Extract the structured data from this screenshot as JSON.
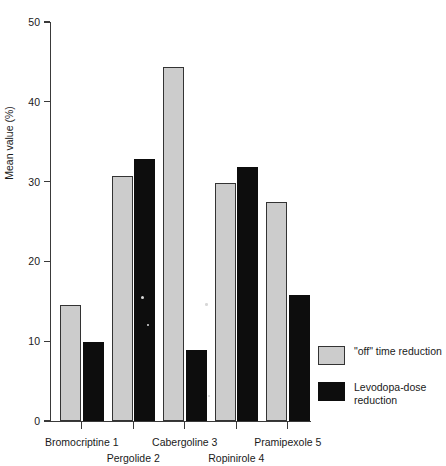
{
  "chart_data": {
    "type": "bar",
    "title": "",
    "xlabel": "",
    "ylabel": "Mean value (%)",
    "ylim": [
      0,
      50
    ],
    "yticks": [
      0,
      10,
      20,
      30,
      40,
      50
    ],
    "grid": false,
    "legend_position": "right",
    "categories": [
      "Bromocriptine 1",
      "Pergolide 2",
      "Cabergoline 3",
      "Ropinirole 4",
      "Pramipexole 5"
    ],
    "series": [
      {
        "name": "\"off\" time reduction",
        "color": "#cccccc",
        "values": [
          14.5,
          30.7,
          44.4,
          29.8,
          27.4
        ]
      },
      {
        "name": "Levodopa-dose reduction",
        "color": "#0d0d0d",
        "values": [
          9.9,
          32.8,
          8.9,
          31.8,
          15.8
        ]
      }
    ]
  },
  "axes": {
    "y_title": "Mean value (%)",
    "y_tick_labels": [
      "0",
      "10",
      "20",
      "30",
      "40",
      "50"
    ],
    "x_tick_labels": [
      "Bromocriptine 1",
      "Pergolide 2",
      "Cabergoline 3",
      "Ropinirole 4",
      "Pramipexole 5"
    ]
  },
  "legend": {
    "items": [
      {
        "label": "\"off\" time reduction",
        "swatch": "light-gray-swatch"
      },
      {
        "label": "Levodopa-dose reduction",
        "swatch": "black-swatch"
      }
    ]
  }
}
